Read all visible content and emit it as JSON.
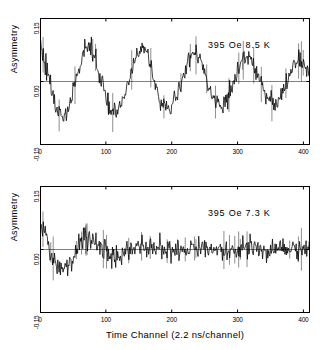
{
  "figure": {
    "x_axis_title": "Time Channel (2.2 ns/channel)",
    "y_axis_title": "Asymmetry"
  },
  "chart_data": [
    {
      "type": "line",
      "title": "",
      "annotation": "395 Oe 8.5 K",
      "xlabel": "Time Channel (2.2 ns/channel)",
      "ylabel": "Asymmetry",
      "xlim": [
        0,
        410
      ],
      "ylim": [
        -0.15,
        0.15
      ],
      "xticks": [
        0,
        100,
        200,
        300,
        400
      ],
      "xticklabels": [
        "0",
        "100",
        "200",
        "300",
        "400"
      ],
      "yticks": [
        -0.15,
        0.0,
        0.15
      ],
      "yticklabels": [
        "-0.15",
        "0.00",
        "0.15"
      ],
      "grid": false,
      "zero_line": true,
      "description": "Muon spin rotation asymmetry showing persistent weakly damped oscillation, period about 80 channels, initial amplitude about 0.09 decaying slowly to about 0.05 by channel 400.",
      "fit": {
        "amplitude": 0.092,
        "period_channels": 80,
        "phase_deg": 25,
        "decay_channels": 620,
        "offset": 0.0
      },
      "noise_sigma": 0.012,
      "peaks": [
        {
          "x": 72,
          "y": 0.088
        },
        {
          "x": 152,
          "y": 0.082
        },
        {
          "x": 232,
          "y": 0.072
        },
        {
          "x": 315,
          "y": 0.062
        }
      ],
      "troughs": [
        {
          "x": 32,
          "y": -0.088
        },
        {
          "x": 112,
          "y": -0.08
        },
        {
          "x": 192,
          "y": -0.068
        },
        {
          "x": 272,
          "y": -0.062
        },
        {
          "x": 358,
          "y": -0.052
        }
      ]
    },
    {
      "type": "line",
      "title": "",
      "annotation": "395 Oe 7.3 K",
      "xlabel": "Time Channel (2.2 ns/channel)",
      "ylabel": "Asymmetry",
      "xlim": [
        0,
        410
      ],
      "ylim": [
        -0.15,
        0.15
      ],
      "xticks": [
        0,
        100,
        200,
        300,
        400
      ],
      "xticklabels": [
        "0",
        "100",
        "200",
        "300",
        "400"
      ],
      "yticks": [
        -0.15,
        0.0,
        0.15
      ],
      "yticklabels": [
        "-0.15",
        "0.00",
        "0.15"
      ],
      "grid": false,
      "zero_line": true,
      "description": "Muon spin rotation asymmetry showing strongly damped oscillation: large negative dip near channel 25, recovery peak near channel 70, then rapid decay to near-zero noise beyond channel 200.",
      "fit": {
        "amplitude": 0.072,
        "period_channels": 82,
        "phase_deg": 25,
        "decay_channels": 70,
        "offset": 0.0
      },
      "noise_sigma": 0.013,
      "peaks": [
        {
          "x": 70,
          "y": 0.042
        },
        {
          "x": 150,
          "y": 0.02
        }
      ],
      "troughs": [
        {
          "x": 25,
          "y": -0.072
        },
        {
          "x": 112,
          "y": -0.016
        }
      ]
    }
  ],
  "panels": [
    {
      "id": "top",
      "annotation": "395 Oe 8.5 K",
      "y_axis_title": "Asymmetry",
      "yticklabels": [
        "0.15",
        "0.00",
        "-0.15"
      ],
      "xticklabels": [
        "0",
        "100",
        "200",
        "300",
        "400"
      ]
    },
    {
      "id": "bottom",
      "annotation": "395 Oe 7.3 K",
      "y_axis_title": "Asymmetry",
      "yticklabels": [
        "0.15",
        "0.00",
        "-0.15"
      ],
      "xticklabels": [
        "0",
        "100",
        "200",
        "300",
        "400"
      ]
    }
  ]
}
